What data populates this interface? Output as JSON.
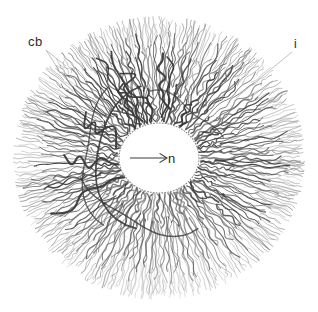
{
  "figure": {
    "kind": "histological-drawing",
    "background_color": "#ffffff",
    "fiber_color": "#3a3a3a",
    "fiber_color_light": "#6f6f6f",
    "outline_color": "#9a9a9a",
    "label_color": "#2b2b2b",
    "canvas": {
      "width": 318,
      "height": 312
    }
  },
  "labels": [
    {
      "id": "cb",
      "text": "cb",
      "x": 28,
      "y": 46,
      "leader_lines": [
        {
          "x1": 46,
          "y1": 50,
          "x2": 60,
          "y2": 72
        },
        {
          "x1": 46,
          "y1": 50,
          "x2": 66,
          "y2": 66
        }
      ]
    },
    {
      "id": "i",
      "text": "i",
      "x": 294,
      "y": 48,
      "leader_lines": [
        {
          "x1": 292,
          "y1": 52,
          "x2": 236,
          "y2": 98
        }
      ]
    },
    {
      "id": "n",
      "text": "n",
      "x": 168,
      "y": 163,
      "leader_lines": [
        {
          "x1": 130,
          "y1": 158,
          "x2": 166,
          "y2": 158
        }
      ]
    }
  ],
  "structures": {
    "cell_outline": {
      "name": "outer-cell-boundary",
      "cx": 159,
      "cy": 158,
      "rx": 146,
      "ry": 142
    },
    "inner_dotted_ring": {
      "name": "inner-dotted-ring",
      "cx": 159,
      "cy": 158,
      "rx": 92,
      "ry": 84
    },
    "nucleus": {
      "name": "nucleus",
      "cx": 159,
      "cy": 158,
      "rx": 40,
      "ry": 35,
      "fill": "#ffffff",
      "border_style": "dotted"
    }
  },
  "chart_data": {
    "type": "scatter",
    "title": "",
    "xlabel": "",
    "ylabel": "",
    "annotations": [
      "cb",
      "i",
      "n"
    ],
    "fiber_count": 112
  }
}
